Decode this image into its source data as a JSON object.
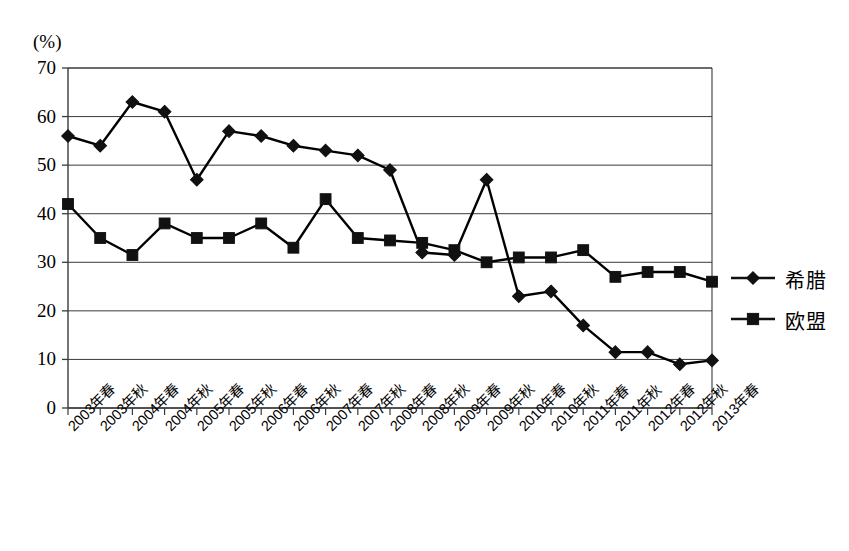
{
  "chart_data": {
    "type": "line",
    "title": "",
    "xlabel": "",
    "ylabel": "(%)",
    "ylim": [
      0,
      70
    ],
    "ytick_step": 10,
    "yticks": [
      "70",
      "60",
      "50",
      "40",
      "30",
      "20",
      "10",
      "0"
    ],
    "grid": "horizontal",
    "legend_position": "right",
    "categories": [
      "2003年春",
      "2003年秋",
      "2004年春",
      "2004年秋",
      "2005年春",
      "2005年秋",
      "2006年春",
      "2006年秋",
      "2007年春",
      "2007年秋",
      "2008年春",
      "2008年秋",
      "2009年春",
      "2009年秋",
      "2010年春",
      "2010年秋",
      "2011年春",
      "2011年秋",
      "2012年春",
      "2012年秋",
      "2013年春"
    ],
    "series": [
      {
        "name": "希腊",
        "marker": "diamond",
        "color": "#000000",
        "values": [
          56,
          54,
          63,
          61,
          47,
          57,
          56,
          54,
          53,
          52,
          49,
          32,
          31.5,
          47,
          23,
          24,
          17,
          11.5,
          11.5,
          9,
          9.8
        ]
      },
      {
        "name": "欧盟",
        "marker": "square",
        "color": "#000000",
        "values": [
          42,
          35,
          31.5,
          38,
          35,
          35,
          38,
          33,
          43,
          35,
          34.5,
          34,
          32.5,
          30,
          31,
          31,
          32.5,
          27,
          28,
          28,
          26
        ]
      }
    ]
  },
  "legend": {
    "items": [
      {
        "label": "希腊",
        "marker": "diamond"
      },
      {
        "label": "欧盟",
        "marker": "square"
      }
    ]
  }
}
